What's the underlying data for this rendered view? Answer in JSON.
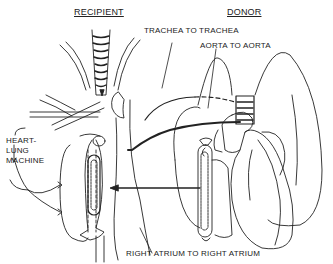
{
  "diagram": {
    "headers": {
      "recipient": "RECIPIENT",
      "donor": "DONOR"
    },
    "labels": {
      "trachea": "TRACHEA TO TRACHEA",
      "aorta": "AORTA TO AORTA",
      "atrium": "RIGHT ATRIUM TO RIGHT ATRIUM",
      "machine_line1": "HEART-",
      "machine_line2": "LUNG",
      "machine_line3": "MACHINE"
    },
    "colors": {
      "ink": "#222222",
      "background": "#ffffff"
    }
  }
}
